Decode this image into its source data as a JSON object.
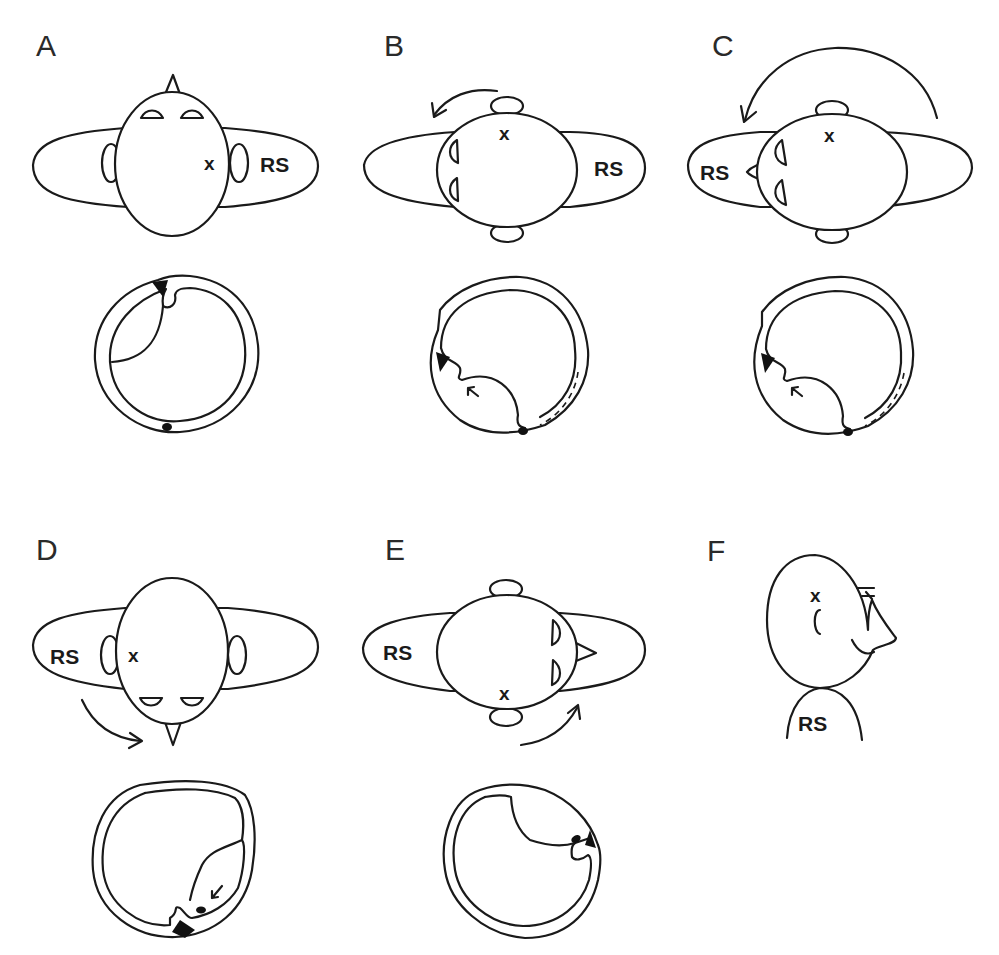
{
  "figure": {
    "panels": [
      {
        "id": "A",
        "label": "A",
        "shoulder_label": "RS",
        "marker": "x",
        "view": "top-down, face up",
        "arrow": "none"
      },
      {
        "id": "B",
        "label": "B",
        "shoulder_label": "RS",
        "marker": "x",
        "view": "head turned 90° left",
        "arrow": "counter-clockwise"
      },
      {
        "id": "C",
        "label": "C",
        "shoulder_label": "RS",
        "marker": "x",
        "view": "body rolled, head turned",
        "arrow": "large counter-clockwise arc"
      },
      {
        "id": "D",
        "label": "D",
        "shoulder_label": "RS",
        "marker": "x",
        "view": "face down",
        "arrow": "clockwise"
      },
      {
        "id": "E",
        "label": "E",
        "shoulder_label": "RS",
        "marker": "x",
        "view": "head turned right",
        "arrow": "counter-clockwise upward"
      },
      {
        "id": "F",
        "label": "F",
        "shoulder_label": "RS",
        "marker": "x",
        "view": "side profile, sitting upright",
        "arrow": "none"
      }
    ],
    "legend": {
      "RS": "RS",
      "x": "x"
    },
    "colors": {
      "line": "#1a1a1a",
      "background": "#ffffff",
      "fill_black": "#111111"
    }
  }
}
